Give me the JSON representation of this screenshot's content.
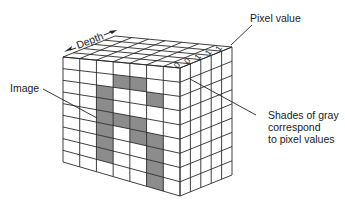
{
  "diagram": {
    "labels": {
      "depth": "Depth",
      "image": "Image",
      "pixel_value": "Pixel value",
      "shades": [
        "Shades of gray",
        "correspond",
        "to pixel values"
      ]
    },
    "top_right_values": [
      "0",
      "0",
      "1",
      "1",
      "1"
    ],
    "grid": {
      "columns": 7,
      "rows": 9,
      "depth_layers": 5,
      "gray_cells": [
        [
          1,
          3
        ],
        [
          1,
          4
        ],
        [
          2,
          2
        ],
        [
          2,
          5
        ],
        [
          3,
          2
        ],
        [
          4,
          2
        ],
        [
          4,
          3
        ],
        [
          4,
          4
        ],
        [
          5,
          2
        ],
        [
          5,
          4
        ],
        [
          5,
          5
        ],
        [
          6,
          2
        ],
        [
          6,
          5
        ],
        [
          7,
          2
        ],
        [
          7,
          5
        ],
        [
          8,
          5
        ]
      ]
    },
    "colors": {
      "line": "#2a2a2a",
      "gray_cell": "#8c8c8c",
      "background": "#ffffff"
    }
  }
}
